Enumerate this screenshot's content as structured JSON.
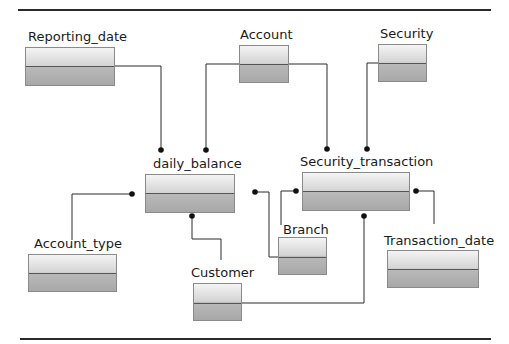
{
  "diagram": {
    "type": "entity-relationship",
    "entities": [
      {
        "id": "reporting_date",
        "label": "Reporting_date"
      },
      {
        "id": "account",
        "label": "Account"
      },
      {
        "id": "security",
        "label": "Security"
      },
      {
        "id": "daily_balance",
        "label": "daily_balance"
      },
      {
        "id": "security_transaction",
        "label": "Security_transaction"
      },
      {
        "id": "account_type",
        "label": "Account_type"
      },
      {
        "id": "branch",
        "label": "Branch"
      },
      {
        "id": "transaction_date",
        "label": "Transaction_date"
      },
      {
        "id": "customer",
        "label": "Customer"
      }
    ],
    "relationships": [
      {
        "from": "Reporting_date",
        "to": "daily_balance"
      },
      {
        "from": "Account",
        "to": "daily_balance"
      },
      {
        "from": "Account",
        "to": "Security_transaction"
      },
      {
        "from": "Security",
        "to": "Security_transaction"
      },
      {
        "from": "Account_type",
        "to": "daily_balance"
      },
      {
        "from": "Customer",
        "to": "daily_balance"
      },
      {
        "from": "Branch",
        "to": "daily_balance"
      },
      {
        "from": "Branch",
        "to": "Security_transaction"
      },
      {
        "from": "Transaction_date",
        "to": "Security_transaction"
      },
      {
        "from": "Customer",
        "to": "Security_transaction"
      }
    ],
    "colors": {
      "line": "#2a2a2a",
      "box_border": "#8a8a8a",
      "box_top": "#f4f4f4",
      "box_bottom": "#a8a8a8"
    }
  }
}
